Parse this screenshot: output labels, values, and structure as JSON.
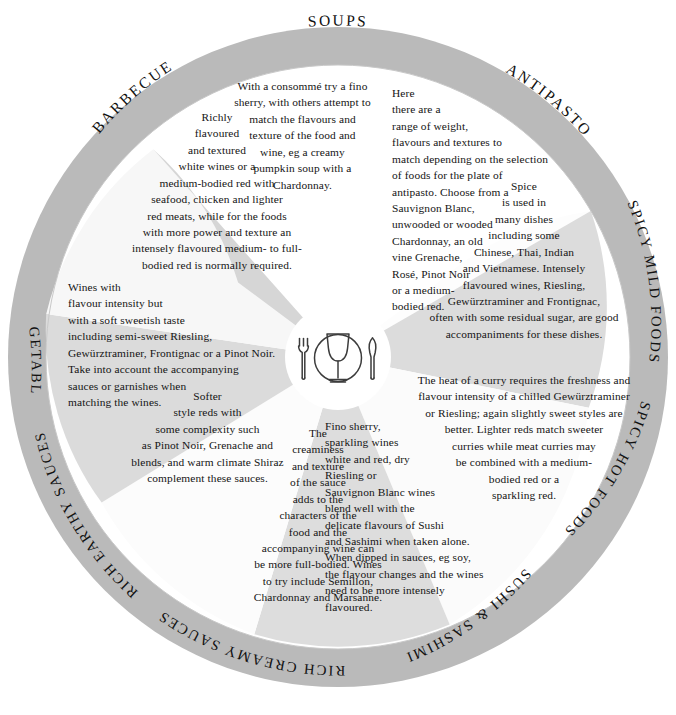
{
  "colors": {
    "ring": "#b9b9b9",
    "wedge_light": "#ffffff",
    "wedge_gray": "#d9d9d9",
    "wedge_gray_alt": "#e6e6e6",
    "center": "#ffffff",
    "text": "#141414",
    "icon_stroke": "#3a3a3a"
  },
  "center": {
    "icon": "place-setting-icon",
    "parts": [
      "fork-icon",
      "wine-glass-icon",
      "plate-icon",
      "knife-icon"
    ]
  },
  "segments": [
    {
      "id": "soups",
      "label": "SOUPS",
      "shade": "light",
      "text": "With a consommé try a fino sherry, with others attempt to match the flavours and texture of the food and wine, eg a creamy pumpkin soup with a Chardonnay.",
      "lines": [
        "With a consommé try a fino",
        "sherry, with others attempt to",
        "match the flavours and",
        "texture of the food and",
        "wine, eg a creamy",
        "pumpkin soup with a",
        "Chardonnay."
      ]
    },
    {
      "id": "antipasto",
      "label": "ANTIPASTO",
      "shade": "light",
      "text": "Here there are a range of weight, flavours and textures to match depending on the selection of foods for the plate of antipasto. Choose from a Sauvignon Blanc, unwooded or wooded Chardonnay, an old vine Grenache, Rosé, Pinot Noir or a medium-bodied red.",
      "lines": [
        "Here",
        "there are a",
        "range of weight,",
        "flavours and textures to",
        "match depending on the selection",
        "of foods for the plate of",
        "antipasto. Choose from a",
        "Sauvignon Blanc,",
        "unwooded or wooded",
        "Chardonnay, an old",
        "vine Grenache,",
        "Rosé, Pinot Noir",
        "or a medium-",
        "bodied red."
      ]
    },
    {
      "id": "spicy-mild-foods",
      "label": "SPICY MILD FOODS",
      "shade": "gray",
      "text": "Spice is used in many dishes including some Chinese, Thai, Indian and Vietnamese. Intensely flavoured wines, Riesling, Gewürztraminer and Frontignac, often with some residual sugar, are good accompaniments for these dishes.",
      "lines": [
        "Spice",
        "is used in",
        "many dishes",
        "including some",
        "Chinese, Thai, Indian",
        "and Vietnamese. Intensely",
        "flavoured wines, Riesling,",
        "Gewürztraminer and Frontignac,",
        "often with some residual sugar, are good",
        "accompaniments for these dishes."
      ]
    },
    {
      "id": "spicy-hot-foods",
      "label": "SPICY HOT FOODS",
      "shade": "light",
      "text": "The heat of a curry requires the freshness and flavour intensity of a chilled Gewürztraminer or Riesling; again slightly sweet styles are better. Lighter reds match sweeter curries while meat curries may be combined with a medium-bodied red or a sparkling red.",
      "lines": [
        "The heat of a curry requires the freshness and",
        "flavour intensity of a chilled Gewürztraminer",
        "or Riesling; again slightly sweet styles are",
        "better. Lighter reds match sweeter",
        "curries while meat curries may",
        "be combined with a medium-",
        "bodied red or a",
        "sparkling red."
      ]
    },
    {
      "id": "sushi-sashimi",
      "label": "SUSHI & SASHIMI",
      "shade": "gray",
      "text": "Fino sherry, sparkling wines white and red, dry Riesling or Sauvignon Blanc wines blend well with the delicate flavours of Sushi and Sashimi when taken alone. When dipped in sauces, eg soy, the flavour changes and the wines need to be more intensely flavoured.",
      "lines": [
        "Fino sherry,",
        "sparkling wines",
        "white and red, dry",
        "Riesling or",
        "Sauvignon Blanc wines",
        "blend well with the",
        "delicate flavours of Sushi",
        "and Sashimi when taken alone.",
        "When dipped in sauces, eg soy,",
        "the flavour changes and the wines",
        "need to be more intensely",
        "flavoured."
      ]
    },
    {
      "id": "rich-creamy-sauces",
      "label": "RICH CREAMY SAUCES",
      "shade": "light",
      "text": "The creaminess and texture of the sauce adds to the characters of the food and the accompanying wine can be more full-bodied. Wines to try include Semillon, Chardonnay and Marsanne.",
      "lines": [
        "The",
        "creaminess",
        "and texture",
        "of the sauce",
        "adds to the",
        "characters of the",
        "food and the",
        "accompanying wine can",
        "be more full-bodied. Wines",
        "to try include Semillon,",
        "Chardonnay and Marsanne."
      ]
    },
    {
      "id": "rich-earthy-sauces",
      "label": "RICH EARTHY SAUCES",
      "shade": "gray",
      "text": "Softer style reds with some complexity such as Pinot Noir, Grenache and blends, and warm climate Shiraz complement these sauces.",
      "lines": [
        "Softer",
        "style reds with",
        "some complexity such",
        "as Pinot Noir, Grenache and",
        "blends, and warm climate Shiraz",
        "complement these sauces."
      ]
    },
    {
      "id": "vegetables",
      "label": "VEGETABLES",
      "shade": "light",
      "text": "Wines with flavour intensity but with a soft sweetish taste including semi-sweet Riesling, Gewürztraminer, Frontignac or a Pinot Noir. Take into account the accompanying sauces or garnishes when matching the wines.",
      "lines": [
        "Wines with",
        "flavour intensity but",
        "with a soft sweetish taste",
        "including semi-sweet Riesling,",
        "Gewürztraminer, Frontignac or a Pinot Noir.",
        "Take into account the accompanying",
        "sauces or garnishes when",
        "matching the wines."
      ]
    },
    {
      "id": "barbecue",
      "label": "BARBECUE",
      "shade": "gray",
      "text": "Richly flavoured and textured white wines or a medium-bodied red with seafood, chicken and lighter red meats, while for the foods with more power and texture an intensely flavoured medium- to full-bodied red is normally required.",
      "lines": [
        "Richly",
        "flavoured",
        "and textured",
        "white wines or a",
        "medium-bodied red with",
        "seafood, chicken and lighter",
        "red meats, while for the foods",
        "with more power and texture an",
        "intensely flavoured medium- to full-",
        "bodied red is normally required."
      ]
    }
  ]
}
